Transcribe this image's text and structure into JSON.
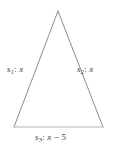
{
  "figure": {
    "type": "isosceles-triangle-diagram",
    "background_color": "#ffffff",
    "stroke_color": "#8c8c8c",
    "base_stroke_color": "#b4b4b4",
    "text_color": "#3a3a3a"
  },
  "geometry": {
    "apex": {
      "x": 58,
      "y": 11
    },
    "bottom_left": {
      "x": 14,
      "y": 127
    },
    "bottom_right": {
      "x": 103,
      "y": 127
    },
    "base_length_px": 89,
    "height_px": 116
  },
  "labels": {
    "left_side": {
      "name": "s",
      "subscript": "1",
      "separator": ":",
      "value": "x",
      "full_text": "s1: x"
    },
    "right_side": {
      "name": "s",
      "subscript": "2",
      "separator": ":",
      "value": "x",
      "full_text": "s2: x"
    },
    "base_side": {
      "name": "s",
      "subscript": "3",
      "separator": ":",
      "value": "x",
      "operator": "−",
      "operand": "5",
      "full_text": "s3: x − 5"
    }
  }
}
